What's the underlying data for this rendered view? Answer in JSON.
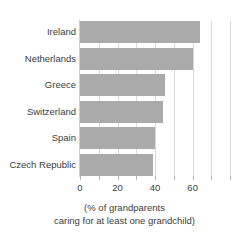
{
  "chart_data": {
    "type": "bar",
    "orientation": "horizontal",
    "title": "",
    "subtitle": "",
    "xlabel": "(% of grandparents caring for at least one grandchild)",
    "ylabel": "",
    "categories": [
      "Ireland",
      "Netherlands",
      "Greece",
      "Switzerland",
      "Spain",
      "Czech Republic"
    ],
    "values": [
      64,
      60,
      45,
      44,
      40,
      39
    ],
    "series": [
      {
        "name": "% of grandparents caring for at least one grandchild",
        "values": [
          64,
          60,
          45,
          44,
          40,
          39
        ]
      }
    ],
    "xlim": [
      0,
      90
    ],
    "xticks": [
      0,
      10,
      20,
      30,
      40,
      50,
      60,
      70,
      80
    ],
    "xtick_labels": [
      {
        "value": 0,
        "label": "0"
      },
      {
        "value": 20,
        "label": "20"
      },
      {
        "value": 40,
        "label": "40"
      },
      {
        "value": 60,
        "label": "60"
      }
    ],
    "grid": true,
    "grid_axis": "x",
    "grid_values": [
      10,
      20,
      30,
      40,
      50,
      60,
      70,
      80
    ],
    "legend": false,
    "legend_position": "none",
    "bar_color": "#aaaaaa",
    "grid_color": "#d9d9d9",
    "axis_color": "#cfcfcf",
    "text_color": "#3c3c3c",
    "background": "#ffffff"
  },
  "caption": {
    "line1": "(% of grandparents",
    "line2": "caring for at least one grandchild)"
  }
}
